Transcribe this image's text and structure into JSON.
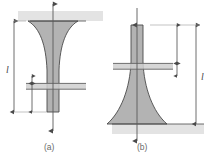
{
  "figure": {
    "background_color": "#ffffff",
    "panels": [
      {
        "id": "a",
        "caption": "(a)",
        "orientation": "suspended-downward",
        "description": "Flared funnel hanging below a horizontal surface band",
        "surface": {
          "type": "horizontal-band",
          "color": "#e3e3e3",
          "position": "top"
        },
        "shape": {
          "fill_color": "#b3b3b3",
          "stroke_color": "#4a4a4a",
          "profile": "concave-flare",
          "wide_end": "top",
          "narrow_end": "bottom"
        },
        "dimensions": [
          {
            "name": "overall-length",
            "label": "l",
            "side": "left",
            "arrow_style": "double-headed"
          },
          {
            "name": "segment-length",
            "label": "",
            "side": "inner-left",
            "arrow_style": "double-headed"
          }
        ],
        "cross_section_band": {
          "color": "#d0d0d0",
          "line_color": "#555555",
          "lines": 2
        },
        "centerline": {
          "arrow_top": "up",
          "arrow_bottom": "down",
          "color": "#5a5a5a"
        }
      },
      {
        "id": "b",
        "caption": "(b)",
        "orientation": "standing-upward",
        "description": "Flared cone standing on a horizontal ground band",
        "surface": {
          "type": "horizontal-band",
          "color": "#e3e3e3",
          "position": "bottom"
        },
        "shape": {
          "fill_color": "#b3b3b3",
          "stroke_color": "#4a4a4a",
          "profile": "concave-flare",
          "wide_end": "bottom",
          "narrow_end": "top"
        },
        "dimensions": [
          {
            "name": "overall-length",
            "label": "l",
            "side": "right",
            "arrow_style": "double-headed"
          },
          {
            "name": "segment-length",
            "label": "",
            "side": "inner-right",
            "arrow_style": "double-headed"
          }
        ],
        "cross_section_band": {
          "color": "#d0d0d0",
          "line_color": "#555555",
          "lines": 2
        },
        "centerline": {
          "arrow_top": "down",
          "arrow_bottom": "down",
          "color": "#5a5a5a"
        }
      }
    ],
    "labels": {
      "length_symbol": "l",
      "caption_a": "(a)",
      "caption_b": "(b)"
    }
  }
}
